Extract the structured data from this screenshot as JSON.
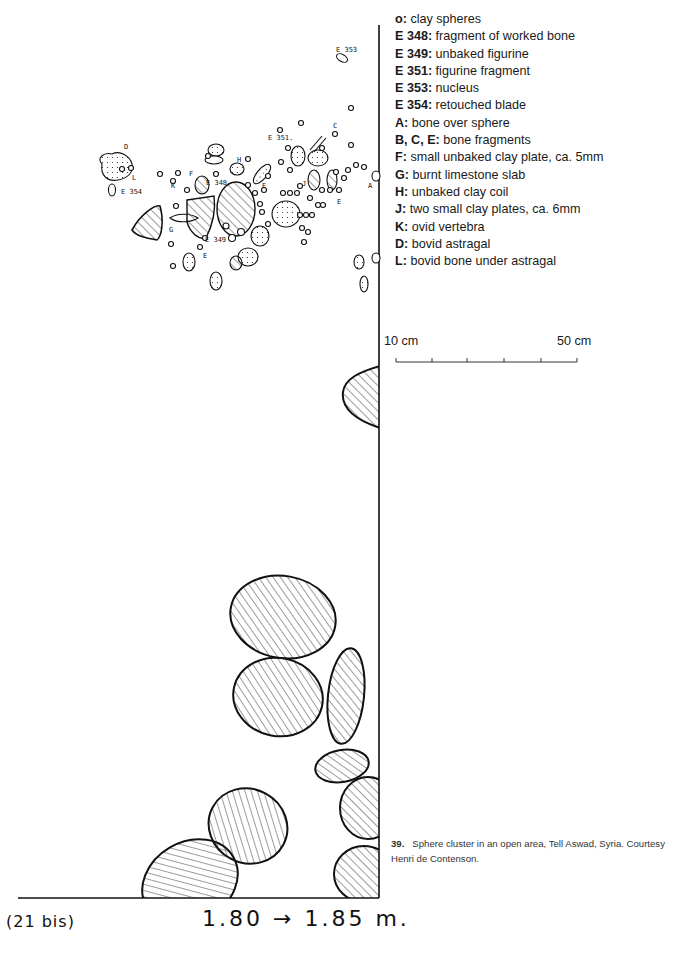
{
  "legend": {
    "items": [
      {
        "key": "o:",
        "desc": " clay spheres"
      },
      {
        "key": "E 348:",
        "desc": " fragment of worked bone"
      },
      {
        "key": "E 349:",
        "desc": " unbaked figurine"
      },
      {
        "key": "E 351:",
        "desc": " figurine fragment"
      },
      {
        "key": "E 353:",
        "desc": " nucleus"
      },
      {
        "key": "E 354:",
        "desc": " retouched blade"
      },
      {
        "key": "A:",
        "desc": " bone over sphere"
      },
      {
        "key": "B, C, E:",
        "desc": " bone fragments"
      },
      {
        "key": "F:",
        "desc": " small unbaked clay plate, ca. 5mm"
      },
      {
        "key": "G:",
        "desc": " burnt limestone slab"
      },
      {
        "key": "H:",
        "desc": " unbaked clay coil"
      },
      {
        "key": "J:",
        "desc": " two small clay plates, ca. 6mm"
      },
      {
        "key": "K:",
        "desc": " ovid vertebra"
      },
      {
        "key": "D:",
        "desc": " bovid astragal"
      },
      {
        "key": "L:",
        "desc": " bovid bone under astragal"
      }
    ]
  },
  "scale_bar": {
    "left_label": "10 cm",
    "right_label": "50 cm",
    "ticks": 6
  },
  "caption": {
    "number": "39.",
    "text": "Sphere cluster in an open area, Tell Aswad, Syria. Courtesy Henri de Contenson."
  },
  "drawing": {
    "sheet_tag": "(21 bis)",
    "depth_label": "1.80 → 1.85 m.",
    "find_labels": {
      "e353": "E 353",
      "e351": "E 351.",
      "e348": "E 348",
      "e349": "E 349",
      "e354": "E 354",
      "a": "A",
      "c": "C",
      "d": "D",
      "e1": "E",
      "e2": "E",
      "e3": "E",
      "f": "F",
      "g": "G",
      "h": "H",
      "j": "J",
      "k": "K",
      "l": "L"
    }
  }
}
